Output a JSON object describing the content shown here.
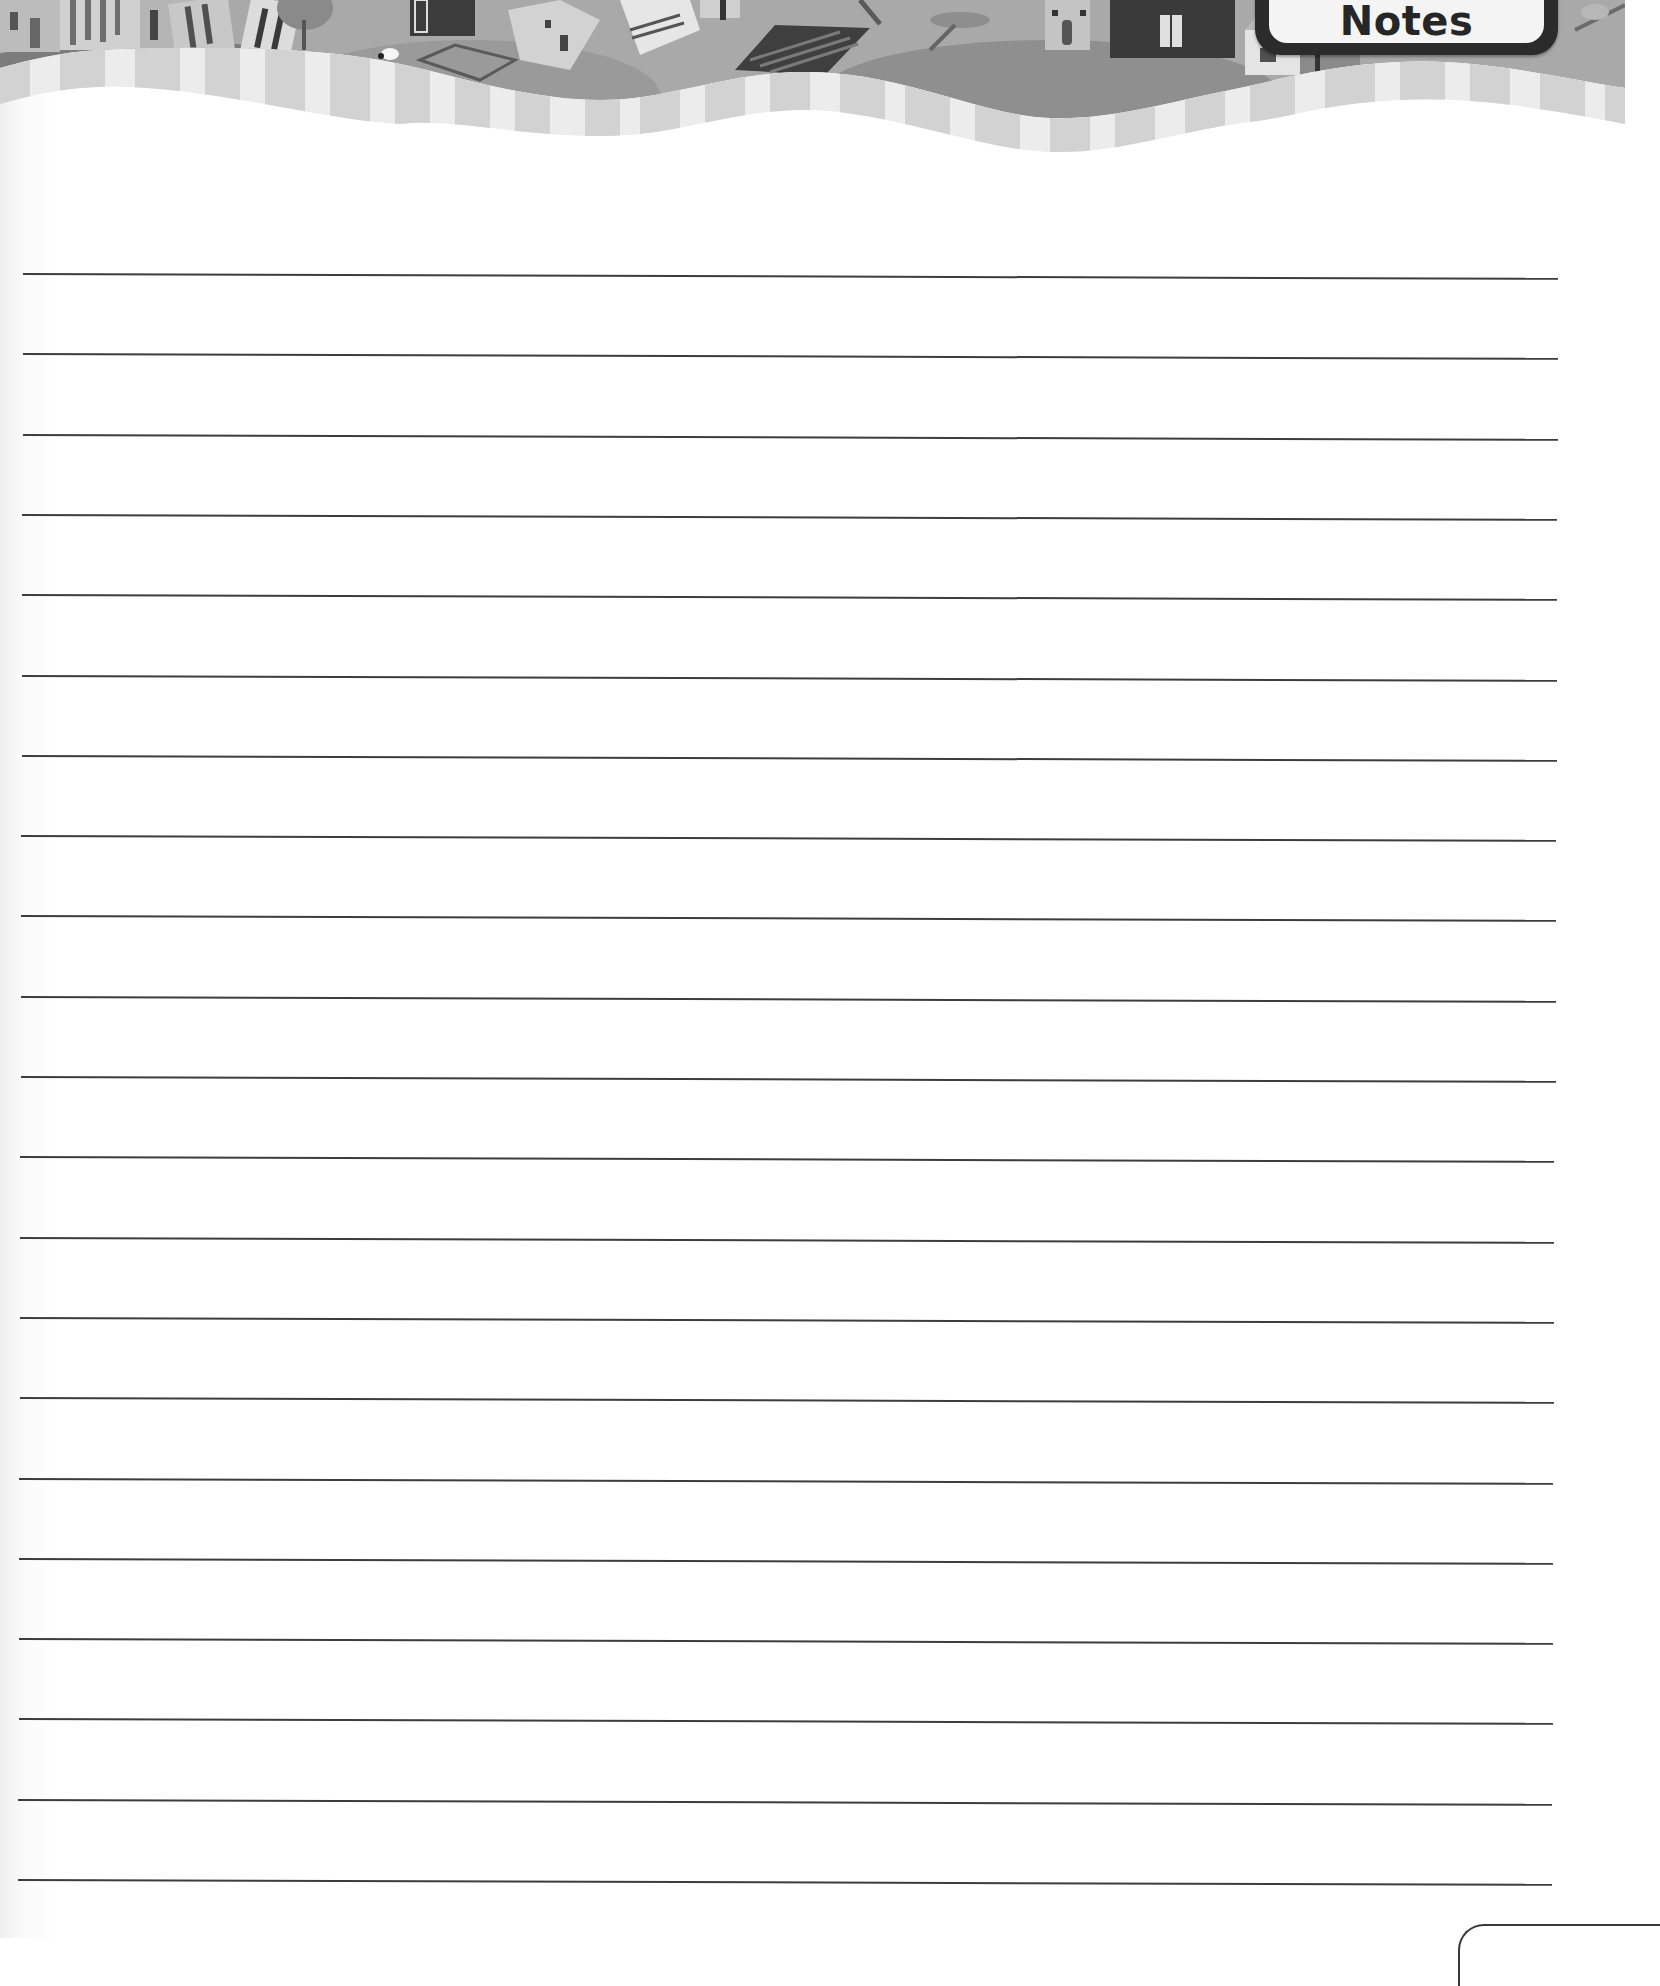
{
  "header": {
    "badge_label": "Notes",
    "illustration": "watercolor-village-banner",
    "stripe_colors": [
      "#d4d4d4",
      "#ececec"
    ]
  },
  "ruled_area": {
    "line_count": 21,
    "first_line_y": 273,
    "line_spacing": 80.3,
    "line_color": "#3d3d3d",
    "lines": [
      {
        "index": 1
      },
      {
        "index": 2
      },
      {
        "index": 3
      },
      {
        "index": 4
      },
      {
        "index": 5
      },
      {
        "index": 6
      },
      {
        "index": 7
      },
      {
        "index": 8
      },
      {
        "index": 9
      },
      {
        "index": 10
      },
      {
        "index": 11
      },
      {
        "index": 12
      },
      {
        "index": 13
      },
      {
        "index": 14
      },
      {
        "index": 15
      },
      {
        "index": 16
      },
      {
        "index": 17
      },
      {
        "index": 18
      },
      {
        "index": 19
      },
      {
        "index": 20
      },
      {
        "index": 21
      }
    ]
  },
  "footer": {
    "page_tab": "page-number-tab"
  }
}
